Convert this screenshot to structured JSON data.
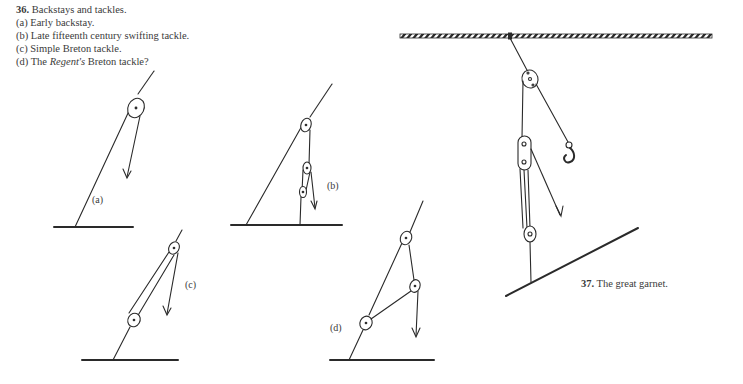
{
  "figure36": {
    "number": "36.",
    "title": "Backstays and tackles.",
    "items": [
      "(a) Early backstay.",
      "(b) Late fifteenth century swifting tackle.",
      "(c) Simple Breton tackle."
    ],
    "item_d_prefix": "(d) The ",
    "item_d_italic": "Regent's",
    "item_d_suffix": " Breton tackle?",
    "labels": {
      "a": "(a)",
      "b": "(b)",
      "c": "(c)",
      "d": "(d)"
    }
  },
  "figure37": {
    "number": "37.",
    "title": "The great garnet."
  }
}
